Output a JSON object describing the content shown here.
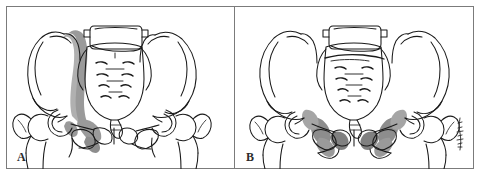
{
  "figure": {
    "panel_count": 2,
    "frame_color": "#7b7b7b",
    "background_color": "#ffffff",
    "line_color": "#1a1a1a",
    "shading_color": "#9a9a9a",
    "shading_color_dark": "#808080",
    "shading_color_light": "#b8b8b8"
  },
  "panels": [
    {
      "id": "panel-a",
      "label": "A",
      "caption": "Unilateral pelvic ring disruption with vertical shear pattern",
      "anatomy": [
        "left iliac wing",
        "right iliac wing",
        "sacrum",
        "L5 vertebra",
        "coccyx",
        "left pubic ramus",
        "right pubic ramus",
        "pubic symphysis",
        "left acetabulum",
        "right acetabulum",
        "left femoral head",
        "right femoral head",
        "left greater trochanter",
        "right greater trochanter",
        "obturator foramen",
        "sacral foramina"
      ],
      "shaded_regions": [
        "left sacroiliac vertical band",
        "left superior pubic ramus",
        "left inferior pubic ramus"
      ],
      "shading_pattern": "unilateral-left",
      "sacral_foramina_rows": 4,
      "has_transverse_sacral_line": false
    },
    {
      "id": "panel-b",
      "label": "B",
      "caption": "Bilateral pubic rami fractures with transverse sacral involvement",
      "anatomy": [
        "left iliac wing",
        "right iliac wing",
        "sacrum",
        "L5 vertebra",
        "coccyx",
        "left pubic ramus",
        "right pubic ramus",
        "pubic symphysis",
        "left acetabulum",
        "right acetabulum",
        "left femoral head",
        "right femoral head",
        "left greater trochanter",
        "right greater trochanter",
        "obturator foramen",
        "sacral foramina"
      ],
      "shaded_regions": [
        "left superior pubic ramus",
        "right superior pubic ramus",
        "left inferior pubic ramus",
        "right inferior pubic ramus",
        "left ischial region",
        "right ischial region"
      ],
      "shading_pattern": "bilateral-symmetric",
      "sacral_foramina_rows": 4,
      "has_transverse_sacral_line": true
    }
  ],
  "signature": {
    "present": true,
    "position": "bottom-right of panel B",
    "description": "vertical artist signature mark"
  }
}
